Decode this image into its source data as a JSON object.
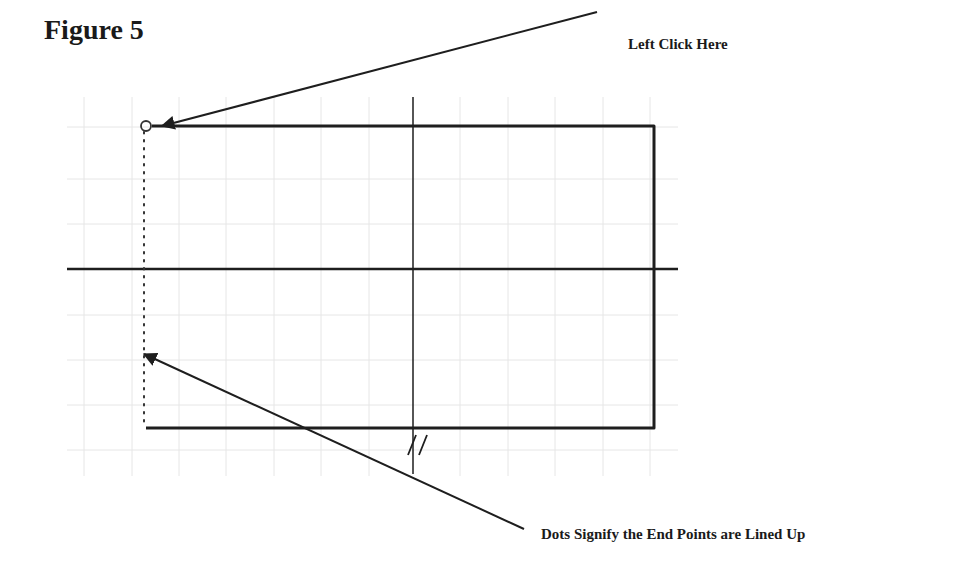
{
  "figure": {
    "title": "Figure 5",
    "annotations": {
      "top": "Left Click Here",
      "bottom": "Dots Signify the End  Points are Lined Up"
    },
    "colors": {
      "grid": "#e6e6e6",
      "line": "#1e1e1e",
      "background": "#ffffff"
    },
    "grid": {
      "x_lines": [
        84,
        132,
        179,
        226,
        274,
        321,
        369,
        460,
        508,
        555,
        603,
        650
      ],
      "y_lines": [
        127,
        179,
        224,
        315,
        360,
        405,
        450
      ],
      "extent": {
        "x1": 67,
        "x2": 678,
        "y1": 97,
        "y2": 476
      }
    }
  }
}
